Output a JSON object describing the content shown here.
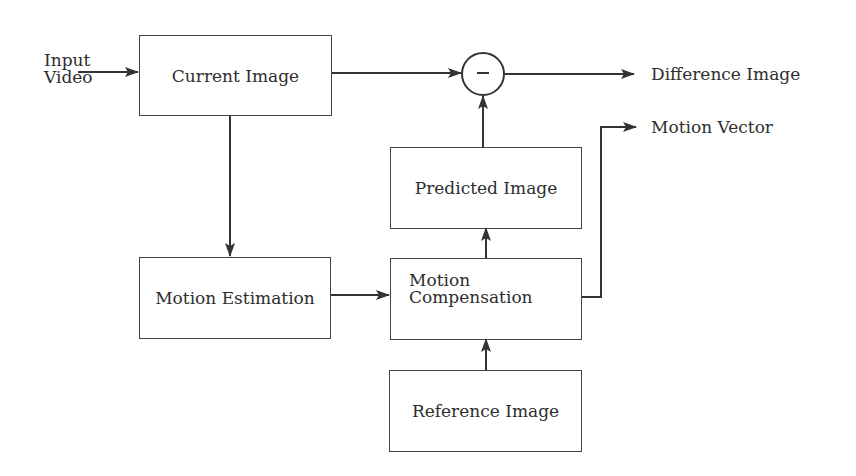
{
  "diagram": {
    "title": "",
    "inputs": {
      "input_line1": "Input",
      "input_line2": "Video"
    },
    "blocks": {
      "current_image": "Current Image",
      "motion_estimation": "Motion Estimation",
      "motion_compensation_line1": "Motion",
      "motion_compensation_line2": "Compensation",
      "predicted_image": "Predicted Image",
      "reference_image": "Reference Image"
    },
    "operator": {
      "symbol": "−",
      "meaning": "subtract"
    },
    "outputs": {
      "difference_image": "Difference Image",
      "motion_vector": "Motion Vector"
    },
    "edges": [
      {
        "from": "Input Video",
        "to": "Current Image"
      },
      {
        "from": "Current Image",
        "to": "Subtractor"
      },
      {
        "from": "Current Image",
        "to": "Motion Estimation"
      },
      {
        "from": "Motion Estimation",
        "to": "Motion Compensation"
      },
      {
        "from": "Reference Image",
        "to": "Motion Compensation"
      },
      {
        "from": "Motion Compensation",
        "to": "Predicted Image"
      },
      {
        "from": "Predicted Image",
        "to": "Subtractor"
      },
      {
        "from": "Subtractor",
        "to": "Difference Image"
      },
      {
        "from": "Motion Compensation",
        "to": "Motion Vector"
      }
    ],
    "colors": {
      "line": "#333333",
      "background": "#ffffff"
    }
  }
}
